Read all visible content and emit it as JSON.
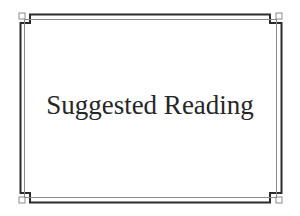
{
  "card": {
    "title": "Suggested Reading",
    "text_color": "#262626",
    "frame_color_outer": "#2b2b2b",
    "frame_color_inner": "#8a8a8a",
    "background": "#ffffff"
  }
}
